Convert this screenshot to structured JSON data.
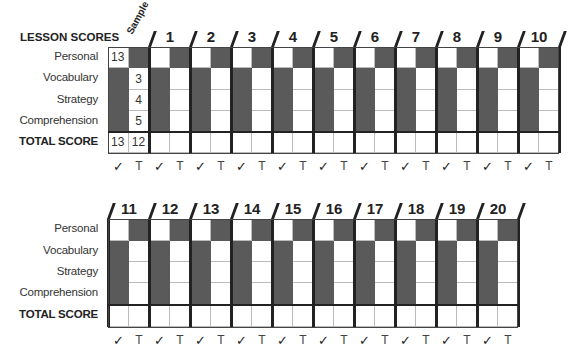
{
  "header": {
    "title": "LESSON SCORES",
    "sample_label": "Sample"
  },
  "rows": [
    {
      "label": "Personal"
    },
    {
      "label": "Vocabulary"
    },
    {
      "label": "Strategy"
    },
    {
      "label": "Comprehension"
    },
    {
      "label": "TOTAL SCORE"
    }
  ],
  "column_marks": {
    "check": "✓",
    "teacher": "T"
  },
  "sample": {
    "personal": "13",
    "vocabulary": "3",
    "strategy": "4",
    "comprehension": "5",
    "total_check": "13",
    "total_teacher": "12"
  },
  "lessons_top": [
    "1",
    "2",
    "3",
    "4",
    "5",
    "6",
    "7",
    "8",
    "9",
    "10"
  ],
  "lessons_bottom": [
    "11",
    "12",
    "13",
    "14",
    "15",
    "16",
    "17",
    "18",
    "19",
    "20"
  ],
  "colors": {
    "shaded": "#5a5a5a",
    "rule": "#222222"
  }
}
